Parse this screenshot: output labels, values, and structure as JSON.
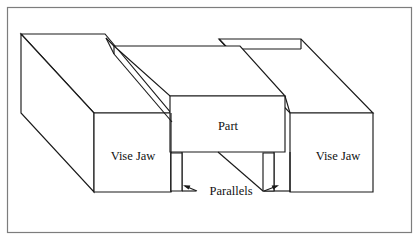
{
  "figure": {
    "domain": "technical-line-diagram",
    "canvas": {
      "width": 419,
      "height": 241
    },
    "colors": {
      "background": "#ffffff",
      "line": "#1a1a1a",
      "face_fill": "#ffffff",
      "frame": "#7d7d7d"
    },
    "frame": {
      "x": 7,
      "y": 7,
      "width": 405,
      "height": 226
    },
    "labels": {
      "part": "Part",
      "vise_jaw_left": "Vise Jaw",
      "vise_jaw_right": "Vise Jaw",
      "parallels": "Parallels"
    },
    "label_positions": {
      "part": {
        "x": 228,
        "y": 126
      },
      "vise_jaw_left": {
        "x": 133,
        "y": 156
      },
      "vise_jaw_right": {
        "x": 338,
        "y": 156
      },
      "parallels": {
        "x": 231,
        "y": 192
      }
    },
    "components": [
      {
        "name": "left-vise-jaw",
        "label": "Vise Jaw",
        "top_face": [
          [
            21,
            34
          ],
          [
            105,
            34
          ],
          [
            171,
            113
          ],
          [
            94,
            113
          ]
        ],
        "front_face": [
          [
            94,
            113
          ],
          [
            171,
            113
          ],
          [
            171,
            192
          ],
          [
            94,
            192
          ]
        ],
        "left_face": [
          [
            21,
            34
          ],
          [
            94,
            113
          ],
          [
            94,
            192
          ],
          [
            21,
            113
          ]
        ]
      },
      {
        "name": "part",
        "label": "Part",
        "top_face": [
          [
            114,
            46
          ],
          [
            240,
            46
          ],
          [
            285,
            96
          ],
          [
            170,
            96
          ]
        ],
        "front_face": [
          [
            170,
            96
          ],
          [
            285,
            96
          ],
          [
            285,
            152
          ],
          [
            170,
            152
          ]
        ]
      },
      {
        "name": "right-vise-jaw",
        "label": "Vise Jaw",
        "top_face": [
          [
            219,
            39
          ],
          [
            301,
            39
          ],
          [
            373,
            113
          ],
          [
            290,
            113
          ]
        ],
        "front_face": [
          [
            290,
            113
          ],
          [
            373,
            113
          ],
          [
            373,
            192
          ],
          [
            290,
            192
          ]
        ]
      },
      {
        "name": "left-parallel",
        "label": "Parallels",
        "front_face": [
          [
            171,
            153
          ],
          [
            182,
            153
          ],
          [
            182,
            191
          ],
          [
            171,
            191
          ]
        ]
      },
      {
        "name": "right-parallel",
        "label": "Parallels",
        "front_face": [
          [
            263,
            153
          ],
          [
            274,
            153
          ],
          [
            274,
            191
          ],
          [
            263,
            191
          ]
        ]
      }
    ],
    "leaders": [
      {
        "name": "parallels-leader-left",
        "from": [
          196,
          190
        ],
        "to": [
          183,
          188
        ]
      },
      {
        "name": "parallels-leader-right",
        "from": [
          265,
          190
        ],
        "to": [
          278,
          188
        ]
      }
    ]
  }
}
